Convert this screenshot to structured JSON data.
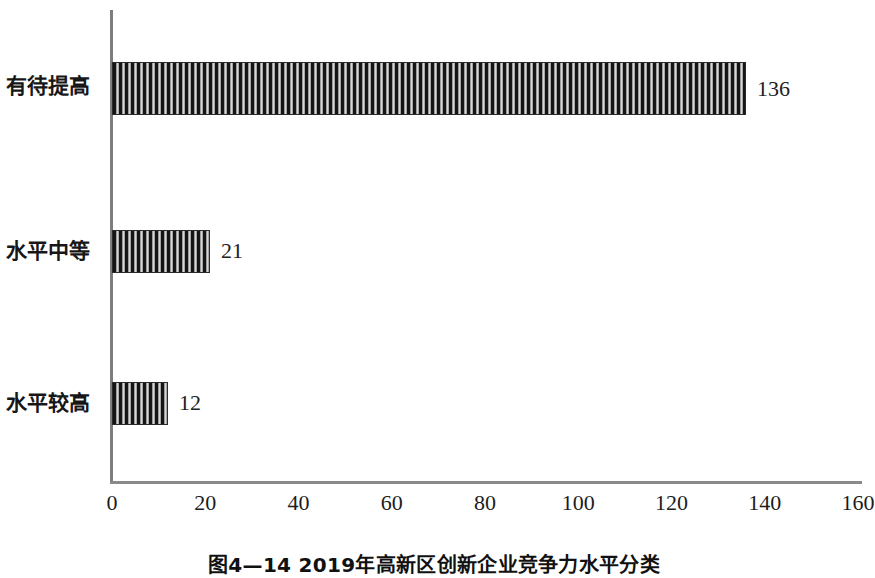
{
  "chart_data": {
    "type": "bar",
    "orientation": "horizontal",
    "title": "",
    "categories": [
      "有待提高",
      "水平中等",
      "水平较高"
    ],
    "values": [
      136,
      21,
      12
    ],
    "data_labels": [
      "136",
      "21",
      "12"
    ],
    "xlabel": "",
    "ylabel": "",
    "xlim": [
      0,
      160
    ],
    "xticks": [
      0,
      20,
      40,
      60,
      80,
      100,
      120,
      140,
      160
    ],
    "xtick_labels": [
      "0",
      "20",
      "40",
      "60",
      "80",
      "100",
      "120",
      "140",
      "160"
    ],
    "grid": false,
    "legend": null,
    "bar_fill": "vertical-hatch",
    "bar_color": "#1b1b1b",
    "axis_color": "#808080"
  },
  "caption": {
    "text": "图4—14  2019年高新区创新企业竞争力水平分类"
  }
}
